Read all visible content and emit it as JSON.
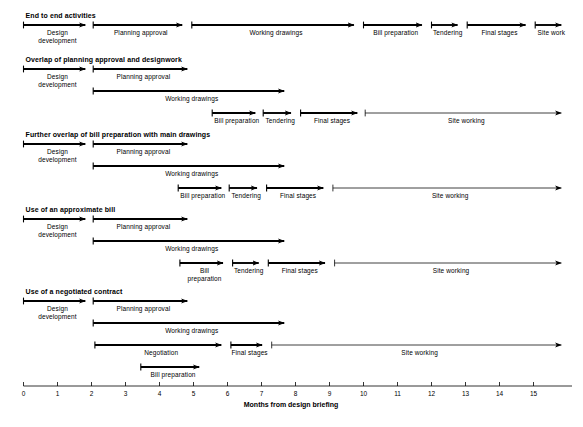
{
  "figure": {
    "type": "gantt-arrow-diagram",
    "axis": {
      "title": "Months from design briefing",
      "ticks": [
        {
          "value": 0,
          "label": "0"
        },
        {
          "value": 1,
          "label": "1"
        },
        {
          "value": 2,
          "label": "2"
        },
        {
          "value": 3,
          "label": "3"
        },
        {
          "value": 4,
          "label": "4"
        },
        {
          "value": 5,
          "label": "5"
        },
        {
          "value": 6,
          "label": "6"
        },
        {
          "value": 7,
          "label": "7"
        },
        {
          "value": 8,
          "label": "8"
        },
        {
          "value": 9,
          "label": "9"
        },
        {
          "value": 10,
          "label": "10"
        },
        {
          "value": 11,
          "label": "11"
        },
        {
          "value": 12,
          "label": "12"
        },
        {
          "value": 13,
          "label": "13"
        },
        {
          "value": 14,
          "label": "14"
        },
        {
          "value": 15,
          "label": "15"
        }
      ],
      "range": [
        0,
        16
      ]
    },
    "scenarios": [
      {
        "id": "end-to-end-activities",
        "title": "End to end activities",
        "lanes": [
          {
            "bars": [
              {
                "label": "Design\ndevelopment",
                "start": 0.0,
                "end": 2.0,
                "weight": "thick",
                "label_pos": "center-below"
              },
              {
                "label": "Planning approval",
                "start": 2.05,
                "end": 4.85,
                "weight": "thick",
                "label_pos": "center-below"
              },
              {
                "label": "Working drawings",
                "start": 4.95,
                "end": 9.9,
                "weight": "thick",
                "label_pos": "center-below"
              },
              {
                "label": "Bill preparation",
                "start": 10.0,
                "end": 11.9,
                "weight": "thick",
                "label_pos": "center-below"
              },
              {
                "label": "Tendering",
                "start": 12.0,
                "end": 12.95,
                "weight": "thick",
                "label_pos": "center-below"
              },
              {
                "label": "Final stages",
                "start": 13.05,
                "end": 14.95,
                "weight": "thick",
                "label_pos": "center-below"
              },
              {
                "label": "Site work",
                "start": 15.05,
                "end": 16.0,
                "weight": "thick",
                "label_pos": "center-below"
              }
            ]
          }
        ]
      },
      {
        "id": "overlap-of-planning-approval-and-designwork",
        "title": "Overlap of planning approval and designwork",
        "lanes": [
          {
            "bars": [
              {
                "label": "Design\ndevelopment",
                "start": 0.0,
                "end": 2.0,
                "weight": "thick",
                "label_pos": "center-below"
              },
              {
                "label": "Planning approval",
                "start": 2.05,
                "end": 5.0,
                "weight": "thick",
                "label_pos": "center-below"
              }
            ]
          },
          {
            "bars": [
              {
                "label": "Working drawings",
                "start": 2.05,
                "end": 7.85,
                "weight": "thick",
                "label_pos": "center-below"
              }
            ]
          },
          {
            "bars": [
              {
                "label": "Bill preparation",
                "start": 5.55,
                "end": 7.0,
                "weight": "thick",
                "label_pos": "center-below"
              },
              {
                "label": "Tendering",
                "start": 7.05,
                "end": 8.05,
                "weight": "thick",
                "label_pos": "center-below"
              },
              {
                "label": "Final stages",
                "start": 8.15,
                "end": 10.0,
                "weight": "thick",
                "label_pos": "center-below"
              },
              {
                "label": "Site working",
                "start": 10.05,
                "end": 16.0,
                "weight": "thin",
                "label_pos": "center-below"
              }
            ]
          }
        ]
      },
      {
        "id": "further-overlap-of-bill-preparation-with-main-drawings",
        "title": "Further overlap of bill preparation with main drawings",
        "lanes": [
          {
            "bars": [
              {
                "label": "Design\ndevelopment",
                "start": 0.0,
                "end": 2.0,
                "weight": "thick",
                "label_pos": "center-below"
              },
              {
                "label": "Planning approval",
                "start": 2.05,
                "end": 5.0,
                "weight": "thick",
                "label_pos": "center-below"
              }
            ]
          },
          {
            "bars": [
              {
                "label": "Working drawings",
                "start": 2.05,
                "end": 7.85,
                "weight": "thick",
                "label_pos": "center-below"
              }
            ]
          },
          {
            "bars": [
              {
                "label": "Bill preparation",
                "start": 4.55,
                "end": 6.0,
                "weight": "thick",
                "label_pos": "center-below"
              },
              {
                "label": "Tendering",
                "start": 6.05,
                "end": 7.05,
                "weight": "thick",
                "label_pos": "center-below"
              },
              {
                "label": "Final stages",
                "start": 7.15,
                "end": 9.0,
                "weight": "thick",
                "label_pos": "center-below"
              },
              {
                "label": "Site working",
                "start": 9.1,
                "end": 16.0,
                "weight": "thin",
                "label_pos": "center-below"
              }
            ]
          }
        ]
      },
      {
        "id": "use-of-an-approximate-bill",
        "title": "Use of an approximate bill",
        "lanes": [
          {
            "bars": [
              {
                "label": "Design\ndevelopment",
                "start": 0.0,
                "end": 2.0,
                "weight": "thick",
                "label_pos": "center-below"
              },
              {
                "label": "Planning approval",
                "start": 2.05,
                "end": 5.0,
                "weight": "thick",
                "label_pos": "center-below"
              }
            ]
          },
          {
            "bars": [
              {
                "label": "Working drawings",
                "start": 2.05,
                "end": 7.85,
                "weight": "thick",
                "label_pos": "center-below"
              }
            ]
          },
          {
            "bars": [
              {
                "label": "Bill\npreparation",
                "start": 4.6,
                "end": 6.05,
                "weight": "thick",
                "label_pos": "center-below"
              },
              {
                "label": "Tendering",
                "start": 6.15,
                "end": 7.1,
                "weight": "thick",
                "label_pos": "center-below"
              },
              {
                "label": "Final stages",
                "start": 7.2,
                "end": 9.05,
                "weight": "thick",
                "label_pos": "center-below"
              },
              {
                "label": "Site working",
                "start": 9.15,
                "end": 16.0,
                "weight": "thin",
                "label_pos": "center-below"
              }
            ]
          }
        ]
      },
      {
        "id": "use-of-a-negotiated-contract",
        "title": "Use of a negotiated contract",
        "lanes": [
          {
            "bars": [
              {
                "label": "Design\ndevelopment",
                "start": 0.0,
                "end": 2.0,
                "weight": "thick",
                "label_pos": "center-below"
              },
              {
                "label": "Planning approval",
                "start": 2.05,
                "end": 5.0,
                "weight": "thick",
                "label_pos": "center-below"
              }
            ]
          },
          {
            "bars": [
              {
                "label": "Working drawings",
                "start": 2.05,
                "end": 7.85,
                "weight": "thick",
                "label_pos": "center-below"
              }
            ]
          },
          {
            "bars": [
              {
                "label": "Negotiation",
                "start": 2.1,
                "end": 6.0,
                "weight": "thick",
                "label_pos": "center-below"
              },
              {
                "label": "Final stages",
                "start": 6.1,
                "end": 7.2,
                "weight": "thick",
                "label_pos": "center-below"
              },
              {
                "label": "Site working",
                "start": 7.3,
                "end": 16.0,
                "weight": "thin",
                "label_pos": "center-below"
              }
            ]
          },
          {
            "bars": [
              {
                "label": "Bill preparation",
                "start": 3.45,
                "end": 5.35,
                "weight": "thick",
                "label_pos": "center-below"
              }
            ]
          }
        ]
      }
    ]
  },
  "chart_data": {
    "type": "bar",
    "xlabel": "Months from design briefing",
    "ylabel": "",
    "xlim": [
      0,
      16
    ],
    "grid": false,
    "legend": "none",
    "categories": [
      "End to end activities",
      "Overlap of planning approval and designwork",
      "Further overlap of bill preparation with main drawings",
      "Use of an approximate bill",
      "Use of a negotiated contract"
    ],
    "series": [
      {
        "name": "End to end activities",
        "tasks": [
          {
            "name": "Design development",
            "start": 0,
            "end": 2,
            "duration": 2
          },
          {
            "name": "Planning approval",
            "start": 2,
            "end": 5,
            "duration": 3
          },
          {
            "name": "Working drawings",
            "start": 5,
            "end": 10,
            "duration": 5
          },
          {
            "name": "Bill preparation",
            "start": 10,
            "end": 12,
            "duration": 2
          },
          {
            "name": "Tendering",
            "start": 12,
            "end": 13,
            "duration": 1
          },
          {
            "name": "Final stages",
            "start": 13,
            "end": 15,
            "duration": 2
          },
          {
            "name": "Site work",
            "start": 15,
            "end": 16,
            "duration": 1
          }
        ],
        "total_duration": 16
      },
      {
        "name": "Overlap of planning approval and designwork",
        "tasks": [
          {
            "name": "Design development",
            "start": 0,
            "end": 2,
            "duration": 2
          },
          {
            "name": "Planning approval",
            "start": 2,
            "end": 5,
            "duration": 3
          },
          {
            "name": "Working drawings",
            "start": 2,
            "end": 8,
            "duration": 6
          },
          {
            "name": "Bill preparation",
            "start": 5.5,
            "end": 7,
            "duration": 1.5
          },
          {
            "name": "Tendering",
            "start": 7,
            "end": 8,
            "duration": 1
          },
          {
            "name": "Final stages",
            "start": 8,
            "end": 10,
            "duration": 2
          },
          {
            "name": "Site working",
            "start": 10,
            "end": 16,
            "duration": 6
          }
        ],
        "total_duration": 16
      },
      {
        "name": "Further overlap of bill preparation with main drawings",
        "tasks": [
          {
            "name": "Design development",
            "start": 0,
            "end": 2,
            "duration": 2
          },
          {
            "name": "Planning approval",
            "start": 2,
            "end": 5,
            "duration": 3
          },
          {
            "name": "Working drawings",
            "start": 2,
            "end": 8,
            "duration": 6
          },
          {
            "name": "Bill preparation",
            "start": 4.5,
            "end": 6,
            "duration": 1.5
          },
          {
            "name": "Tendering",
            "start": 6,
            "end": 7,
            "duration": 1
          },
          {
            "name": "Final stages",
            "start": 7,
            "end": 9,
            "duration": 2
          },
          {
            "name": "Site working",
            "start": 9,
            "end": 16,
            "duration": 7
          }
        ],
        "total_duration": 16
      },
      {
        "name": "Use of an approximate bill",
        "tasks": [
          {
            "name": "Design development",
            "start": 0,
            "end": 2,
            "duration": 2
          },
          {
            "name": "Planning approval",
            "start": 2,
            "end": 5,
            "duration": 3
          },
          {
            "name": "Working drawings",
            "start": 2,
            "end": 8,
            "duration": 6
          },
          {
            "name": "Bill preparation",
            "start": 4.6,
            "end": 6,
            "duration": 1.4
          },
          {
            "name": "Tendering",
            "start": 6.1,
            "end": 7.1,
            "duration": 1
          },
          {
            "name": "Final stages",
            "start": 7.2,
            "end": 9,
            "duration": 1.8
          },
          {
            "name": "Site working",
            "start": 9.1,
            "end": 16,
            "duration": 6.9
          }
        ],
        "total_duration": 16
      },
      {
        "name": "Use of a negotiated contract",
        "tasks": [
          {
            "name": "Design development",
            "start": 0,
            "end": 2,
            "duration": 2
          },
          {
            "name": "Planning approval",
            "start": 2,
            "end": 5,
            "duration": 3
          },
          {
            "name": "Working drawings",
            "start": 2,
            "end": 8,
            "duration": 6
          },
          {
            "name": "Negotiation",
            "start": 2.1,
            "end": 6,
            "duration": 3.9
          },
          {
            "name": "Bill preparation",
            "start": 3.45,
            "end": 5.35,
            "duration": 1.9
          },
          {
            "name": "Final stages",
            "start": 6.1,
            "end": 7.2,
            "duration": 1.1
          },
          {
            "name": "Site working",
            "start": 7.3,
            "end": 16,
            "duration": 8.7
          }
        ],
        "total_duration": 16
      }
    ]
  }
}
